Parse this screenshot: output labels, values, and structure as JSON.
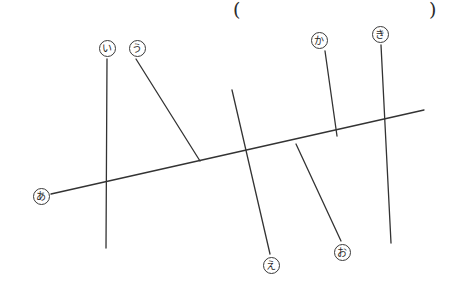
{
  "figure": {
    "type": "line-intersection-diagram",
    "width": 463,
    "height": 290,
    "background_color": "#ffffff",
    "stroke_color": "#333333",
    "stroke_width": 1.3,
    "answer_field": {
      "open_paren": "(",
      "close_paren": ")",
      "value": "",
      "placeholder": ""
    },
    "labels": [
      {
        "id": "a",
        "text": "あ",
        "x": 41,
        "y": 196
      },
      {
        "id": "i",
        "text": "い",
        "x": 107,
        "y": 48
      },
      {
        "id": "u",
        "text": "う",
        "x": 137,
        "y": 48
      },
      {
        "id": "e",
        "text": "え",
        "x": 271,
        "y": 265
      },
      {
        "id": "o",
        "text": "お",
        "x": 342,
        "y": 252
      },
      {
        "id": "ka",
        "text": "か",
        "x": 319,
        "y": 40
      },
      {
        "id": "ki",
        "text": "き",
        "x": 380,
        "y": 34
      }
    ],
    "lines": [
      {
        "id": "line-a",
        "label": "あ",
        "x1": 51,
        "y1": 194,
        "x2": 424,
        "y2": 110
      },
      {
        "id": "line-i",
        "label": "い",
        "x1": 107,
        "y1": 59,
        "x2": 106,
        "y2": 248
      },
      {
        "id": "line-u",
        "label": "う",
        "x1": 136,
        "y1": 59,
        "x2": 200,
        "y2": 161
      },
      {
        "id": "line-e",
        "label": "え",
        "x1": 232,
        "y1": 90,
        "x2": 270,
        "y2": 254
      },
      {
        "id": "line-o",
        "label": "お",
        "x1": 296,
        "y1": 144,
        "x2": 341,
        "y2": 241
      },
      {
        "id": "line-ka",
        "label": "か",
        "x1": 325,
        "y1": 51,
        "x2": 337,
        "y2": 136
      },
      {
        "id": "line-ki",
        "label": "き",
        "x1": 381,
        "y1": 45,
        "x2": 391,
        "y2": 243
      }
    ]
  }
}
